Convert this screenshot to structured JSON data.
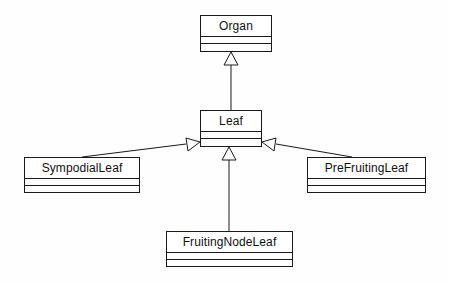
{
  "diagram": {
    "type": "uml-class-diagram",
    "background_color": "#ffffff",
    "line_color": "#1a1a1a",
    "fill_color": "#ffffff",
    "classes": [
      {
        "id": "organ",
        "name": "Organ",
        "x": 200,
        "y": 15,
        "width": 72,
        "height": 37,
        "attributes": [],
        "operations": []
      },
      {
        "id": "leaf",
        "name": "Leaf",
        "x": 200,
        "y": 110,
        "width": 62,
        "height": 37,
        "attributes": [],
        "operations": []
      },
      {
        "id": "sympodial-leaf",
        "name": "SympodialLeaf",
        "x": 24,
        "y": 157,
        "width": 116,
        "height": 36,
        "attributes": [],
        "operations": []
      },
      {
        "id": "prefruiting-leaf",
        "name": "PreFruitingLeaf",
        "x": 307,
        "y": 157,
        "width": 119,
        "height": 36,
        "attributes": [],
        "operations": []
      },
      {
        "id": "fruiting-node-leaf",
        "name": "FruitingNodeLeaf",
        "x": 166,
        "y": 231,
        "width": 127,
        "height": 36,
        "attributes": [],
        "operations": []
      }
    ],
    "relationships": [
      {
        "id": "leaf-to-organ",
        "type": "generalization",
        "source": "leaf",
        "target": "organ",
        "label": ""
      },
      {
        "id": "sympodial-to-leaf",
        "type": "generalization",
        "source": "sympodial-leaf",
        "target": "leaf",
        "label": ""
      },
      {
        "id": "fruitingnode-to-leaf",
        "type": "generalization",
        "source": "fruiting-node-leaf",
        "target": "leaf",
        "label": ""
      },
      {
        "id": "prefruiting-to-leaf",
        "type": "generalization",
        "source": "prefruiting-leaf",
        "target": "leaf",
        "label": ""
      }
    ]
  }
}
